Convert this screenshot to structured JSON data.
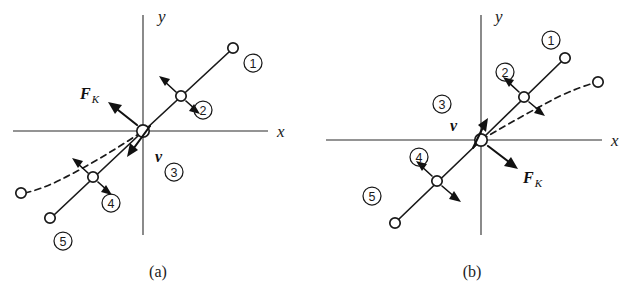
{
  "figure": {
    "background_color": "#ffffff",
    "ink_color": "#1a1a1a",
    "panels": [
      {
        "id": "panel-a",
        "caption": "(a)",
        "axes": {
          "x_label": "x",
          "y_label": "y"
        },
        "vectors": [
          {
            "name": "friction",
            "label": "F",
            "subscript": "K",
            "direction": "up-left"
          },
          {
            "name": "velocity",
            "label": "v",
            "subscript": "",
            "direction": "down-left"
          }
        ],
        "position_markers": [
          "1",
          "2",
          "3",
          "4",
          "5"
        ],
        "description": "Particle trajectory: solid straight line from upper-right to lower-left through origin, with a dashed curved path branching toward lower-left."
      },
      {
        "id": "panel-b",
        "caption": "(b)",
        "axes": {
          "x_label": "x",
          "y_label": "y"
        },
        "vectors": [
          {
            "name": "friction",
            "label": "F",
            "subscript": "K",
            "direction": "down-right"
          },
          {
            "name": "velocity",
            "label": "v",
            "subscript": "",
            "direction": "up-right"
          }
        ],
        "position_markers": [
          "1",
          "2",
          "3",
          "4",
          "5"
        ],
        "description": "Particle trajectory: solid straight line from lower-left to upper-right through origin, with a dashed curved path branching toward upper-right."
      }
    ]
  },
  "labels": {
    "axis_x": "x",
    "axis_y": "y",
    "force_symbol": "F",
    "force_subscript": "K",
    "velocity_symbol": "v",
    "num_1": "1",
    "num_2": "2",
    "num_3": "3",
    "num_4": "4",
    "num_5": "5",
    "caption_a": "(a)",
    "caption_b": "(b)"
  }
}
